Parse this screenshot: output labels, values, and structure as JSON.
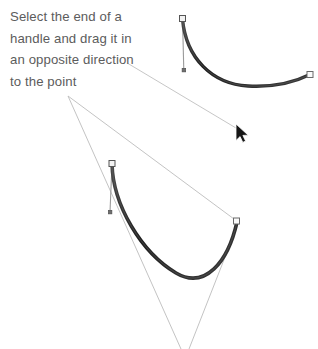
{
  "instruction": {
    "name": "instruction-caption",
    "lines": [
      "Select the end of a",
      "handle and drag it in",
      "an opposite direction",
      "to the point"
    ],
    "text": "Select the end of a\nhandle and drag it in\nan opposite direction\nto the point",
    "color": "#5c5c5c",
    "font_size_px": 13
  },
  "colors": {
    "background": "#ffffff",
    "curve_stroke": "#2b2b2b",
    "curve_stroke_highlight": "#585858",
    "handle_line": "#8a8a8a",
    "leader_line": "#b9b9b9",
    "anchor_fill": "#f2f2f2",
    "anchor_stroke": "#4a4a4a",
    "handle_point_fill": "#6f6f6f",
    "cursor_fill": "#1a1a1a",
    "cursor_stroke": "#ffffff",
    "text": "#5c5c5c"
  },
  "canvas": {
    "width": 318,
    "height": 349
  },
  "shapes": {
    "top_curve": {
      "name": "bezier-curve-top",
      "label": "top bezier curve",
      "path": "M 182.5 19 C 186 58 212 84 248 86 C 276 87.5 297 81 310 74.5",
      "stroke_width": 3.2,
      "anchors": [
        {
          "name": "anchor-point-top-left",
          "x": 182.5,
          "y": 19,
          "type": "square-hollow",
          "size": 6
        },
        {
          "name": "anchor-point-top-right",
          "x": 310,
          "y": 74.5,
          "type": "square-hollow",
          "size": 6
        }
      ],
      "handles": [
        {
          "name": "handle-top-left",
          "from_x": 182.5,
          "from_y": 19,
          "to_x": 183.8,
          "to_y": 70,
          "endpoint_type": "square-filled",
          "endpoint_size": 3.4
        }
      ]
    },
    "bottom_curve": {
      "name": "bezier-curve-bottom",
      "label": "bottom bezier curve",
      "path": "M 112 164 C 113 205 141 252 176 273 C 205 290 228 262 237 222",
      "stroke_width": 3.4,
      "anchors": [
        {
          "name": "anchor-point-bottom-left",
          "x": 112,
          "y": 164,
          "type": "square-hollow",
          "size": 6
        },
        {
          "name": "anchor-point-bottom-right",
          "x": 236.5,
          "y": 221,
          "type": "square-hollow",
          "size": 6
        }
      ],
      "handles": [
        {
          "name": "handle-bottom-left",
          "from_x": 112,
          "from_y": 164,
          "to_x": 110,
          "to_y": 212,
          "endpoint_type": "square-filled",
          "endpoint_size": 3.4
        }
      ]
    }
  },
  "leader_lines": [
    {
      "name": "leader-line-to-cursor",
      "from_x": 128,
      "from_y": 63.5,
      "to_x": 241,
      "to_y": 131
    },
    {
      "name": "leader-line-vertex-to-bottom-right-anchor",
      "from_x": 68,
      "from_y": 96,
      "to_x": 234,
      "to_y": 219
    },
    {
      "name": "leader-line-vertex-to-bottom-converge",
      "from_x": 68,
      "from_y": 96,
      "to_x": 181,
      "to_y": 349
    },
    {
      "name": "leader-line-bottom-right-anchor-to-converge",
      "from_x": 238,
      "from_y": 224,
      "to_x": 189,
      "to_y": 349
    }
  ],
  "cursor": {
    "name": "mouse-cursor-arrow",
    "x": 238,
    "y": 126,
    "scale": 1.0
  }
}
